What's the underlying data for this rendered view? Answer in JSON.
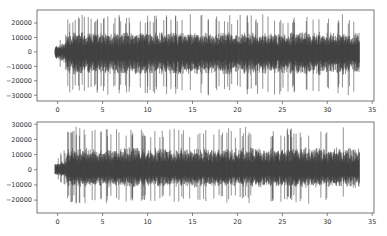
{
  "chart_data": [
    {
      "type": "line",
      "title": "",
      "xlabel": "",
      "ylabel": "",
      "xlim": [
        -2.3,
        35.2
      ],
      "ylim": [
        -34000,
        29000
      ],
      "xticks": [
        0,
        5,
        10,
        15,
        20,
        25,
        30,
        35
      ],
      "yticks": [
        -30000,
        -20000,
        -10000,
        0,
        10000,
        20000
      ],
      "ytick_labels": [
        "−30000",
        "−20000",
        "−10000",
        "0",
        "10000",
        "20000"
      ],
      "signal": {
        "start": -0.3,
        "end": 33.6,
        "peak_pos": 27000,
        "peak_neg": -31000
      },
      "grid": false,
      "line_color": "#3a3a3a"
    },
    {
      "type": "line",
      "title": "",
      "xlabel": "",
      "ylabel": "",
      "xlim": [
        -2.3,
        35.2
      ],
      "ylim": [
        -28500,
        31500
      ],
      "xticks": [
        0,
        5,
        10,
        15,
        20,
        25,
        30,
        35
      ],
      "yticks": [
        -20000,
        -10000,
        0,
        10000,
        20000,
        30000
      ],
      "ytick_labels": [
        "−20000",
        "−10000",
        "0",
        "10000",
        "20000",
        "30000"
      ],
      "signal": {
        "start": -0.3,
        "end": 33.6,
        "peak_pos": 29000,
        "peak_neg": -23000
      },
      "grid": false,
      "line_color": "#3a3a3a"
    }
  ],
  "layout": {
    "axes": [
      {
        "left": 37,
        "top": 10,
        "width": 337,
        "height": 91
      },
      {
        "left": 37,
        "top": 122,
        "width": 337,
        "height": 91
      }
    ]
  }
}
